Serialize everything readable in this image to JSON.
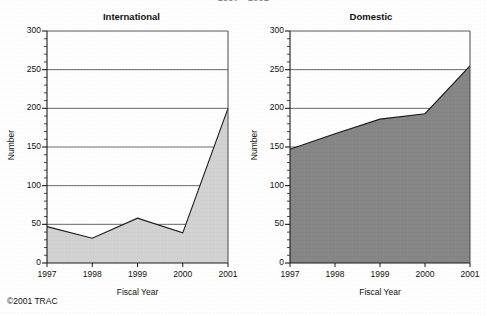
{
  "document": {
    "clipped_header": "1997 - 2001",
    "copyright": "©2001 TRAC"
  },
  "chart_data": [
    {
      "type": "area",
      "title": "International",
      "xlabel": "Fiscal Year",
      "ylabel": "Number",
      "categories": [
        "1997",
        "1998",
        "1999",
        "2000",
        "2001"
      ],
      "x": [
        1997,
        1998,
        1999,
        2000,
        2001
      ],
      "values": [
        47,
        32,
        58,
        39,
        200
      ],
      "ylim": [
        0,
        300
      ],
      "xlim": [
        1997,
        2001
      ],
      "ytick_labels": [
        "0",
        "50",
        "100",
        "150",
        "200",
        "250",
        "300"
      ],
      "ytick_values": [
        0,
        50,
        100,
        150,
        200,
        250,
        300
      ],
      "yminor_step": 10,
      "grid": true,
      "legend": "none",
      "fill_color": "#d2d2d2",
      "line_color": "#1a1a1a"
    },
    {
      "type": "area",
      "title": "Domestic",
      "xlabel": "Fiscal Year",
      "ylabel": "Number",
      "categories": [
        "1997",
        "1998",
        "1999",
        "2000",
        "2001"
      ],
      "x": [
        1997,
        1998,
        1999,
        2000,
        2001
      ],
      "values": [
        147,
        167,
        186,
        193,
        255
      ],
      "ylim": [
        0,
        300
      ],
      "xlim": [
        1997,
        2001
      ],
      "ytick_labels": [
        "0",
        "50",
        "100",
        "150",
        "200",
        "250",
        "300"
      ],
      "ytick_values": [
        0,
        50,
        100,
        150,
        200,
        250,
        300
      ],
      "yminor_step": 10,
      "grid": true,
      "legend": "none",
      "fill_color": "#878787",
      "line_color": "#1a1a1a"
    }
  ]
}
